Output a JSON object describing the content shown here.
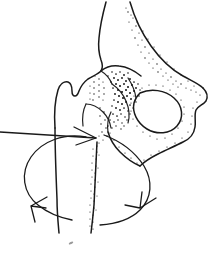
{
  "figure": {
    "title": "Hip joint rotation diagram",
    "background_color": "#ffffff",
    "ink_color": "#1a1a1a",
    "stipple_color": "#111111",
    "width": 221,
    "height": 257
  },
  "anatomy": {
    "parts": [
      {
        "name": "ilium",
        "label": "Ilium"
      },
      {
        "name": "iliac-wing",
        "label": "Iliac wing"
      },
      {
        "name": "acetabulum",
        "label": "Acetabulum"
      },
      {
        "name": "femoral-head",
        "label": "Femoral head"
      },
      {
        "name": "femoral-neck",
        "label": "Femoral neck"
      },
      {
        "name": "greater-trochanter",
        "label": "Greater trochanter"
      },
      {
        "name": "lesser-trochanter",
        "label": "Lesser trochanter"
      },
      {
        "name": "femoral-shaft",
        "label": "Femoral shaft"
      },
      {
        "name": "obturator-foramen",
        "label": "Obturator foramen"
      },
      {
        "name": "ischium",
        "label": "Ischium"
      },
      {
        "name": "ischial-tuberosity",
        "label": "Ischial tuberosity"
      },
      {
        "name": "superior-pubic-ramus",
        "label": "Superior pubic ramus"
      },
      {
        "name": "inferior-pubic-ramus",
        "label": "Inferior pubic ramus"
      }
    ]
  },
  "annotations": {
    "arrows": [
      {
        "name": "external-rotation-arrow",
        "label": "External rotation",
        "position": "lower-left",
        "direction": "counter-clockwise",
        "head_points": "left-down"
      },
      {
        "name": "internal-rotation-arrow",
        "label": "Internal rotation",
        "position": "lower-right",
        "direction": "clockwise",
        "head_points": "right-down"
      },
      {
        "name": "axis-pointer-arrow",
        "label": "Rotation axis pointer",
        "position": "mid-left",
        "direction": "right",
        "head_points": "right"
      }
    ],
    "text_labels": []
  }
}
